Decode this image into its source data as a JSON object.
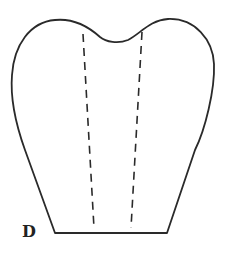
{
  "figure": {
    "label": "D",
    "colors": {
      "stroke": "#2a2a2a",
      "background": "#ffffff",
      "label": "#222222"
    }
  }
}
